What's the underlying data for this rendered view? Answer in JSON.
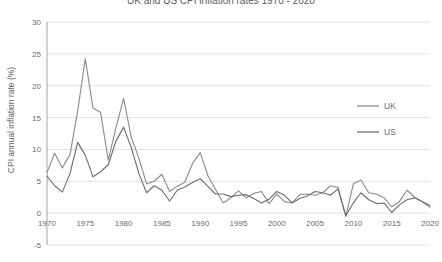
{
  "chart_data": {
    "type": "line",
    "title": "UK and US CPI inflation rates 1970 - 2020",
    "xlabel": "",
    "ylabel": "CPI annual inflation rate (%)",
    "xlim": [
      1970,
      2020
    ],
    "ylim": [
      -5,
      30
    ],
    "ytick_labels": [
      "30",
      "25",
      "20",
      "15",
      "10",
      "5",
      "0",
      "-5"
    ],
    "ytick_values": [
      30,
      25,
      20,
      15,
      10,
      5,
      0,
      -5
    ],
    "xtick_labels": [
      "1970",
      "1975",
      "1980",
      "1985",
      "1990",
      "1995",
      "2000",
      "2005",
      "2010",
      "2015",
      "2020"
    ],
    "xtick_values": [
      1970,
      1975,
      1980,
      1985,
      1990,
      1995,
      2000,
      2005,
      2010,
      2015,
      2020
    ],
    "grid": true,
    "legend_position": "right",
    "x": [
      1970,
      1971,
      1972,
      1973,
      1974,
      1975,
      1976,
      1977,
      1978,
      1979,
      1980,
      1981,
      1982,
      1983,
      1984,
      1985,
      1986,
      1987,
      1988,
      1989,
      1990,
      1991,
      1992,
      1993,
      1994,
      1995,
      1996,
      1997,
      1998,
      1999,
      2000,
      2001,
      2002,
      2003,
      2004,
      2005,
      2006,
      2007,
      2008,
      2009,
      2010,
      2011,
      2012,
      2013,
      2014,
      2015,
      2016,
      2017,
      2018,
      2019,
      2020
    ],
    "series": [
      {
        "name": "UK",
        "color": "#8d8d8d",
        "values": [
          6.4,
          9.4,
          7.1,
          9.2,
          16.0,
          24.2,
          16.5,
          15.8,
          8.3,
          13.4,
          18.0,
          11.9,
          8.6,
          4.6,
          5.0,
          6.1,
          3.4,
          4.2,
          4.9,
          7.8,
          9.5,
          5.9,
          3.7,
          1.6,
          2.4,
          3.5,
          2.4,
          3.1,
          3.4,
          1.5,
          3.0,
          1.8,
          1.6,
          2.9,
          3.0,
          2.8,
          3.2,
          4.3,
          4.0,
          -0.5,
          4.6,
          5.2,
          3.2,
          3.0,
          2.4,
          1.0,
          1.8,
          3.6,
          2.5,
          1.8,
          0.9
        ]
      },
      {
        "name": "US",
        "color": "#6f6f6f",
        "values": [
          5.8,
          4.3,
          3.3,
          6.2,
          11.1,
          9.1,
          5.7,
          6.5,
          7.6,
          11.3,
          13.5,
          10.3,
          6.2,
          3.2,
          4.3,
          3.6,
          1.9,
          3.6,
          4.1,
          4.8,
          5.4,
          4.2,
          3.0,
          3.0,
          2.6,
          2.8,
          2.9,
          2.3,
          1.6,
          2.2,
          3.4,
          2.8,
          1.6,
          2.3,
          2.7,
          3.4,
          3.2,
          2.8,
          3.8,
          -0.4,
          1.6,
          3.2,
          2.1,
          1.5,
          1.6,
          0.1,
          1.3,
          2.1,
          2.4,
          1.8,
          1.2
        ]
      }
    ]
  },
  "legend": {
    "items": [
      {
        "label": "UK"
      },
      {
        "label": "US"
      }
    ]
  }
}
